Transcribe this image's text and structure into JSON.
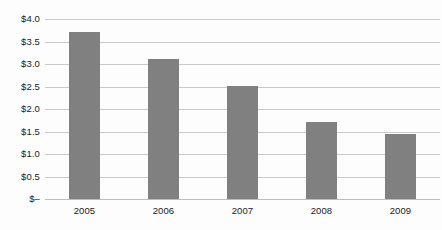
{
  "chart_data": {
    "type": "bar",
    "title": "",
    "subtitle": "",
    "xlabel": "",
    "ylabel": "",
    "categories": [
      "2005",
      "2006",
      "2007",
      "2008",
      "2009"
    ],
    "values": [
      3.7,
      3.1,
      2.5,
      1.7,
      1.45
    ],
    "series": [
      {
        "name": "",
        "values": [
          3.7,
          3.1,
          2.5,
          1.7,
          1.45
        ]
      }
    ],
    "ylim": [
      0,
      4.0
    ],
    "ytick_values": [
      4.0,
      3.5,
      3.0,
      2.5,
      2.0,
      1.5,
      1.0,
      0.5,
      0
    ],
    "ytick_labels": [
      "$4.0",
      "$3.5",
      "$3.0",
      "$2.5",
      "$2.0",
      "$1.5",
      "$1.0",
      "$0.5",
      "$–"
    ],
    "grid": true,
    "legend": false,
    "legend_position": "none",
    "annotations": [],
    "colors": {
      "bar": "#808080",
      "gridline": "#c9c9c9",
      "baseline": "#bdbdbd",
      "background": "#fdfdfd",
      "text": "#1a1a1a"
    }
  }
}
